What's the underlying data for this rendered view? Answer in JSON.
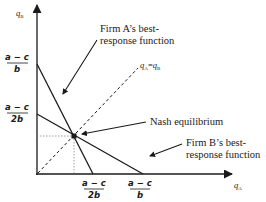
{
  "diagram": {
    "type": "best-response-functions",
    "axes": {
      "x_label": "q",
      "x_sub": "A",
      "y_label": "q",
      "y_sub": "B"
    },
    "y_ticks": [
      {
        "num": "a − c",
        "den": "b",
        "meaning": "Firm A best-response intercept"
      },
      {
        "num": "a − c",
        "den": "2b",
        "meaning": "Firm B best-response intercept"
      }
    ],
    "x_ticks": [
      {
        "num": "a − c",
        "den": "2b",
        "meaning": "Firm A best-response intercept"
      },
      {
        "num": "a − c",
        "den": "b",
        "meaning": "Firm B best-response intercept"
      }
    ],
    "diagonal": {
      "label_q1": "q",
      "label_s1": "A",
      "label_eq": "=",
      "label_q2": "q",
      "label_s2": "B",
      "style": "dashed"
    },
    "annotations": {
      "firm_a_line1": "Firm A’s best-",
      "firm_a_line2": "response function",
      "nash": "Nash equilibrium",
      "firm_b_line1": "Firm B’s best-",
      "firm_b_line2": "response function"
    },
    "colors": {
      "line": "#1a1a1a",
      "guide": "#888888",
      "background": "#ffffff"
    }
  }
}
